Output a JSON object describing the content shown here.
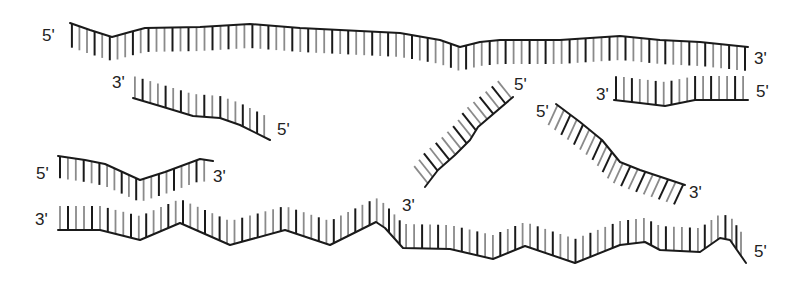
{
  "figure": {
    "colors": {
      "backbone": "#1a1a1a",
      "tick_dark": "#1a1a1a",
      "tick_light": "#8a8a8a",
      "label": "#222222"
    },
    "strands": [
      {
        "id": "top-long-strand",
        "backbone": [
          [
            70,
            23
          ],
          [
            90,
            30
          ],
          [
            112,
            37
          ],
          [
            130,
            32
          ],
          [
            145,
            28
          ],
          [
            200,
            27
          ],
          [
            250,
            24
          ],
          [
            300,
            28
          ],
          [
            340,
            30
          ],
          [
            400,
            33
          ],
          [
            440,
            40
          ],
          [
            460,
            47
          ],
          [
            480,
            42
          ],
          [
            500,
            40
          ],
          [
            560,
            40
          ],
          [
            620,
            36
          ],
          [
            660,
            40
          ],
          [
            700,
            42
          ],
          [
            748,
            47
          ]
        ],
        "tick_dir": [
          0,
          1
        ],
        "tick_len": 24,
        "spacing": 8,
        "labels": [
          {
            "text": "5'",
            "x": 42,
            "y": 41
          },
          {
            "text": "3'",
            "x": 754,
            "y": 64
          }
        ]
      },
      {
        "id": "short-strand-left",
        "backbone": [
          [
            133,
            98
          ],
          [
            160,
            106
          ],
          [
            193,
            116
          ],
          [
            220,
            118
          ],
          [
            240,
            125
          ],
          [
            270,
            140
          ]
        ],
        "tick_dir": [
          0,
          -1
        ],
        "tick_len": 22,
        "spacing": 8,
        "labels": [
          {
            "text": "3'",
            "x": 112,
            "y": 88
          },
          {
            "text": "5'",
            "x": 277,
            "y": 135
          }
        ]
      },
      {
        "id": "right-upper-strand",
        "backbone": [
          [
            614,
            100
          ],
          [
            640,
            103
          ],
          [
            665,
            106
          ],
          [
            695,
            100
          ],
          [
            720,
            100
          ],
          [
            748,
            100
          ]
        ],
        "tick_dir": [
          0,
          -1
        ],
        "tick_len": 24,
        "spacing": 8,
        "labels": [
          {
            "text": "3'",
            "x": 596,
            "y": 100
          },
          {
            "text": "5'",
            "x": 756,
            "y": 97
          }
        ]
      },
      {
        "id": "diagonal-strand-left",
        "backbone": [
          [
            513,
            97
          ],
          [
            478,
            127
          ],
          [
            470,
            140
          ],
          [
            455,
            155
          ],
          [
            438,
            170
          ],
          [
            425,
            187
          ]
        ],
        "tick_dir": [
          -0.62,
          -0.78
        ],
        "tick_len": 22,
        "spacing": 8,
        "labels": [
          {
            "text": "5'",
            "x": 514,
            "y": 90
          },
          {
            "text": "3'",
            "x": 402,
            "y": 211
          }
        ]
      },
      {
        "id": "diagonal-strand-right",
        "backbone": [
          [
            556,
            104
          ],
          [
            580,
            122
          ],
          [
            602,
            140
          ],
          [
            620,
            162
          ],
          [
            640,
            170
          ],
          [
            685,
            185
          ]
        ],
        "tick_dir": [
          -0.42,
          0.91
        ],
        "tick_len": 22,
        "spacing": 8,
        "labels": [
          {
            "text": "5'",
            "x": 536,
            "y": 117
          },
          {
            "text": "3'",
            "x": 689,
            "y": 198
          }
        ]
      },
      {
        "id": "middle-left-strand",
        "backbone": [
          [
            58,
            156
          ],
          [
            85,
            160
          ],
          [
            105,
            164
          ],
          [
            140,
            180
          ],
          [
            165,
            172
          ],
          [
            200,
            159
          ],
          [
            213,
            161
          ]
        ],
        "tick_dir": [
          0,
          1
        ],
        "tick_len": 22,
        "spacing": 8,
        "labels": [
          {
            "text": "5'",
            "x": 36,
            "y": 179
          },
          {
            "text": "3'",
            "x": 213,
            "y": 182
          }
        ]
      },
      {
        "id": "bottom-long-strand",
        "backbone": [
          [
            58,
            230
          ],
          [
            100,
            230
          ],
          [
            140,
            240
          ],
          [
            180,
            223
          ],
          [
            230,
            245
          ],
          [
            285,
            230
          ],
          [
            330,
            245
          ],
          [
            376,
            222
          ],
          [
            385,
            228
          ],
          [
            403,
            248
          ],
          [
            450,
            249
          ],
          [
            493,
            259
          ],
          [
            525,
            246
          ],
          [
            575,
            263
          ],
          [
            620,
            245
          ],
          [
            645,
            242
          ],
          [
            660,
            250
          ],
          [
            700,
            252
          ],
          [
            720,
            238
          ],
          [
            730,
            240
          ],
          [
            746,
            263
          ]
        ],
        "tick_dir": [
          0,
          -1
        ],
        "tick_len": 24,
        "spacing": 8,
        "labels": [
          {
            "text": "3'",
            "x": 35,
            "y": 225
          },
          {
            "text": "5'",
            "x": 754,
            "y": 257
          }
        ]
      }
    ]
  }
}
